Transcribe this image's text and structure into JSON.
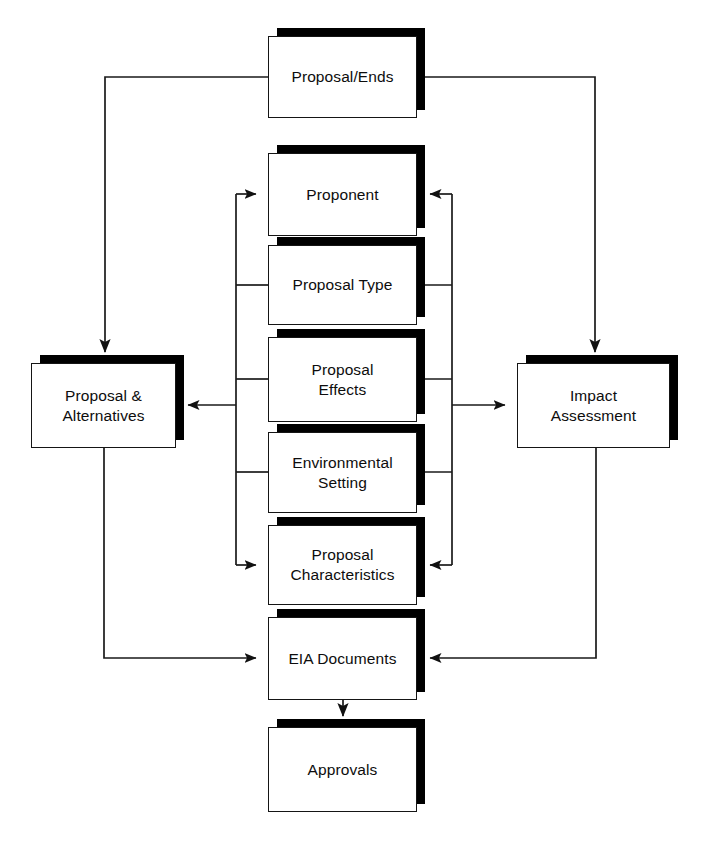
{
  "diagram": {
    "style": {
      "box_fill": "#ffffff",
      "box_border": "#151515",
      "shadow_color": "#000000",
      "line_color": "#1a1a1a",
      "text_color": "#0d0d0d",
      "background": "#ffffff"
    },
    "nodes": [
      {
        "id": "proposal-ends",
        "label": "Proposal/Ends",
        "x": 268,
        "y": 36,
        "w": 149,
        "h": 82
      },
      {
        "id": "proponent",
        "label": "Proponent",
        "x": 268,
        "y": 153,
        "w": 149,
        "h": 83
      },
      {
        "id": "proposal-type",
        "label": "Proposal Type",
        "x": 268,
        "y": 245,
        "w": 149,
        "h": 80
      },
      {
        "id": "proposal-effects",
        "label": "Proposal\nEffects",
        "x": 268,
        "y": 337,
        "w": 149,
        "h": 85
      },
      {
        "id": "environmental-setting",
        "label": "Environmental\nSetting",
        "x": 268,
        "y": 432,
        "w": 149,
        "h": 81
      },
      {
        "id": "proposal-characteristics",
        "label": "Proposal\nCharacteristics",
        "x": 268,
        "y": 525,
        "w": 149,
        "h": 80
      },
      {
        "id": "eia-documents",
        "label": "EIA Documents",
        "x": 268,
        "y": 617,
        "w": 149,
        "h": 83
      },
      {
        "id": "approvals",
        "label": "Approvals",
        "x": 268,
        "y": 727,
        "w": 149,
        "h": 85
      },
      {
        "id": "proposal-alternatives",
        "label": "Proposal &\nAlternatives",
        "x": 31,
        "y": 363,
        "w": 145,
        "h": 85
      },
      {
        "id": "impact-assessment",
        "label": "Impact\nAssessment",
        "x": 517,
        "y": 363,
        "w": 153,
        "h": 85
      }
    ],
    "edges": [
      {
        "id": "proposal-ends-to-proposal-alternatives",
        "from": "proposal-ends",
        "to": "proposal-alternatives",
        "arrow": "down"
      },
      {
        "id": "proposal-ends-to-impact-assessment",
        "from": "proposal-ends",
        "to": "impact-assessment",
        "arrow": "down"
      },
      {
        "id": "left-bus-to-proponent",
        "from": "left-bus",
        "to": "proponent",
        "arrow": "right"
      },
      {
        "id": "left-bus-to-proposal-characteristics",
        "from": "left-bus",
        "to": "proposal-characteristics",
        "arrow": "right"
      },
      {
        "id": "left-bus-to-proposal-alternatives",
        "from": "left-bus",
        "to": "proposal-alternatives",
        "arrow": "left"
      },
      {
        "id": "right-bus-to-proponent",
        "from": "right-bus",
        "to": "proponent",
        "arrow": "left"
      },
      {
        "id": "right-bus-to-proposal-characteristics",
        "from": "right-bus",
        "to": "proposal-characteristics",
        "arrow": "left"
      },
      {
        "id": "right-bus-to-impact-assessment",
        "from": "right-bus",
        "to": "impact-assessment",
        "arrow": "right"
      },
      {
        "id": "proposal-alternatives-to-eia-documents",
        "from": "proposal-alternatives",
        "to": "eia-documents",
        "arrow": "right"
      },
      {
        "id": "impact-assessment-to-eia-documents",
        "from": "impact-assessment",
        "to": "eia-documents",
        "arrow": "left"
      },
      {
        "id": "eia-documents-to-approvals",
        "from": "eia-documents",
        "to": "approvals",
        "arrow": "down"
      }
    ]
  }
}
